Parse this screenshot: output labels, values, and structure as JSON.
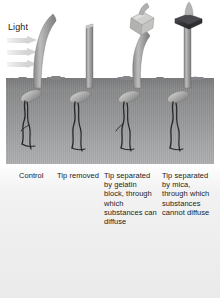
{
  "figure": {
    "light_label": "Light",
    "light_arrow_count": 3,
    "soil_color": "#939496",
    "sky_color": "#ffffff",
    "background_color": "#eaeaea",
    "coleoptile_color": "#a8a8a8",
    "gelatin_color": "#b9bab8",
    "mica_color": "#3b3b3d",
    "root_color": "#272727"
  },
  "specimens": [
    {
      "id": "control",
      "caption": "Control",
      "tip": "intact",
      "barrier": "none",
      "response": "bends toward light"
    },
    {
      "id": "tip-removed",
      "caption": "Tip removed",
      "tip": "removed",
      "barrier": "none",
      "response": "no bending"
    },
    {
      "id": "gelatin-block",
      "caption": "Tip separated by gelatin block, through which substances can diffuse",
      "tip": "intact",
      "barrier": "gelatin block",
      "response": "bends toward light"
    },
    {
      "id": "mica-plate",
      "caption": "Tip separated by mica, through which substances cannot diffuse",
      "tip": "intact",
      "barrier": "mica",
      "response": "no bending"
    }
  ]
}
